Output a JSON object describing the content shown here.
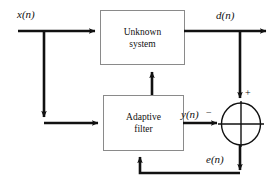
{
  "diagram": {
    "colors": {
      "line": "#111111",
      "box_stroke": "#8a8a8a",
      "background": "#ffffff"
    },
    "blocks": [
      {
        "id": "unknown_system",
        "label": "Unknown\nsystem"
      },
      {
        "id": "adaptive_filter",
        "label": "Adaptive\nfilter"
      }
    ],
    "signals": [
      {
        "id": "input",
        "label": "x(n)"
      },
      {
        "id": "desired",
        "label": "d(n)"
      },
      {
        "id": "filter_output",
        "label": "y(n)"
      },
      {
        "id": "error",
        "label": "e(n)"
      }
    ],
    "summing_junction": {
      "id": "adder",
      "plus_sign": "+",
      "minus_sign": "−"
    }
  }
}
